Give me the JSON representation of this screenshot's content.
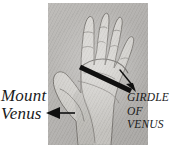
{
  "figure": {
    "type": "annotated-photograph",
    "caption_absent": true
  },
  "photo": {
    "name": "palm-photograph",
    "background_color": "#b4b2b0",
    "skin_color": "#cfcdc9",
    "outline_color": "#6d6a66",
    "left": 48,
    "top": 3,
    "width": 100,
    "height": 142
  },
  "annotations": {
    "marker_color": "#111111",
    "items": [
      {
        "id": "mount-venus",
        "label_lines": [
          "Mount",
          "Venus"
        ],
        "style": "italic",
        "case": "mixed",
        "pointer": "arrow-left",
        "points_to": "thenar eminence (base of thumb)"
      },
      {
        "id": "girdle-of-venus",
        "label_lines": [
          "GIRDLE",
          "OF",
          "VENUS"
        ],
        "style": "italic",
        "case": "upper",
        "pointer": "arrow-down-right",
        "points_to": "curved crease below the fingers",
        "marker": "thick-diagonal-bar"
      }
    ]
  },
  "labels": {
    "mount_venus": {
      "line1": "Mount",
      "line2": "Venus"
    },
    "girdle_of_venus": {
      "line1": "GIRDLE",
      "line2": "OF",
      "line3": "VENUS"
    }
  }
}
